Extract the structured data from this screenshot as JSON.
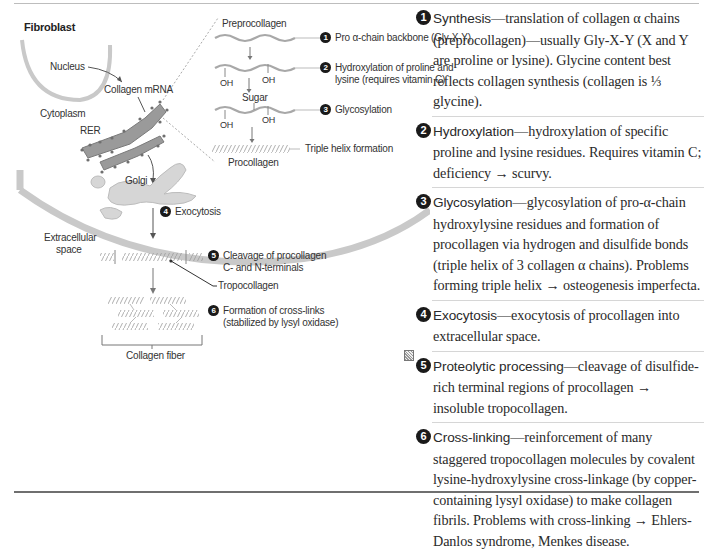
{
  "diagram": {
    "cell_title": "Fibroblast",
    "labels": {
      "nucleus": "Nucleus",
      "collagen_mrna": "Collagen mRNA",
      "cytoplasm": "Cytoplasm",
      "rer": "RER",
      "golgi": "Golgi",
      "extracellular_space_line1": "Extracellular",
      "extracellular_space_line2": "space",
      "preprocollagen": "Preprocollagen",
      "sugar": "Sugar",
      "oh": "OH",
      "procollagen": "Procollagen",
      "triple_helix": "Triple helix formation",
      "tropocollagen": "Tropocollagen",
      "collagen_fiber": "Collagen fiber"
    },
    "steps": [
      {
        "num": "1",
        "line1": "Pro α-chain backbone (Gly-X-Y)",
        "line2": ""
      },
      {
        "num": "2",
        "line1": "Hydroxylation of proline and",
        "line2": "lysine (requires vitamin C)"
      },
      {
        "num": "3",
        "line1": "Glycosylation",
        "line2": ""
      },
      {
        "num": "4",
        "line1": "Exocytosis",
        "line2": ""
      },
      {
        "num": "5",
        "line1": "Cleavage of procollagen",
        "line2": "C- and N-terminals"
      },
      {
        "num": "6",
        "line1": "Formation of cross-links",
        "line2": "(stabilized by lysyl oxidase)"
      }
    ]
  },
  "descriptions": [
    {
      "num": "1",
      "term": "Synthesis",
      "text": "—translation of collagen α chains (preprocollagen)—usually Gly-X-Y (X and Y are proline or lysine). Glycine content best reflects collagen synthesis (collagen is ⅓ glycine)."
    },
    {
      "num": "2",
      "term": "Hydroxylation",
      "text": "—hydroxylation of specific proline and lysine residues. Requires vitamin C; deficiency → scurvy."
    },
    {
      "num": "3",
      "term": "Glycosylation",
      "text": "—glycosylation of pro-α-chain hydroxylysine residues and formation of procollagen via hydrogen and disulfide bonds (triple helix of 3 collagen α chains). Problems forming triple helix → osteogenesis imperfecta."
    },
    {
      "num": "4",
      "term": "Exocytosis",
      "text": "—exocytosis of procollagen into extracellular space."
    },
    {
      "num": "5",
      "term": "Proteolytic processing",
      "text": "—cleavage of disulfide-rich terminal regions of procollagen → insoluble tropocollagen."
    },
    {
      "num": "6",
      "term": "Cross-linking",
      "text": "—reinforcement of many staggered tropocollagen molecules by covalent lysine-hydroxylysine cross-linkage (by copper-containing lysyl oxidase) to make collagen fibrils. Problems with cross-linking → Ehlers-Danlos syndrome, Menkes disease."
    }
  ]
}
